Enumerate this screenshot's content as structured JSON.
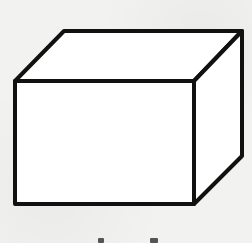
{
  "figure": {
    "type": "rectangular-prism",
    "stroke_color": "#111111",
    "face_color": "#ffffff",
    "background_color": "#f2f2f0",
    "vertices": {
      "front_top_left": [
        15,
        81
      ],
      "front_top_right": [
        194,
        81
      ],
      "front_bottom_left": [
        15,
        204
      ],
      "front_bottom_right": [
        194,
        204
      ],
      "back_top_left": [
        64,
        31
      ],
      "back_top_right": [
        242,
        31
      ],
      "back_bottom_right": [
        242,
        156
      ]
    }
  },
  "caption": {
    "visible": "partially cropped marks at bottom edge"
  }
}
